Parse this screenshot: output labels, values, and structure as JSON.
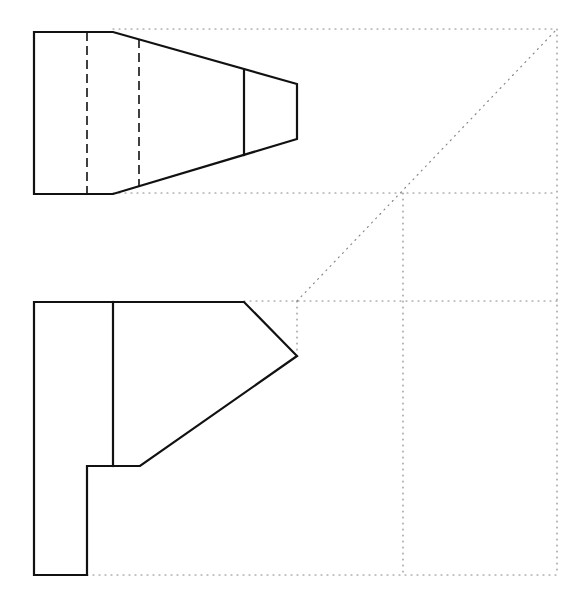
{
  "diagram": {
    "type": "orthographic-projection",
    "views": [
      "top-view",
      "front-view",
      "side-view-construction"
    ],
    "colors": {
      "object_line": "#111111",
      "projection_line": "#888888",
      "background": "#ffffff"
    },
    "top_view": {
      "outline": [
        [
          34,
          32
        ],
        [
          113,
          32
        ],
        [
          297,
          84
        ],
        [
          297,
          139
        ],
        [
          113,
          194
        ],
        [
          34,
          194
        ]
      ],
      "visible_lines": [
        [
          [
            244,
            70
          ],
          [
            244,
            155
          ]
        ]
      ],
      "hidden_lines": [
        [
          [
            87,
            32
          ],
          [
            87,
            194
          ]
        ],
        [
          [
            139,
            39
          ],
          [
            139,
            187
          ]
        ]
      ]
    },
    "front_view": {
      "outline": [
        [
          34,
          302
        ],
        [
          244,
          302
        ],
        [
          297,
          356
        ],
        [
          140,
          466
        ],
        [
          87,
          466
        ],
        [
          87,
          575
        ],
        [
          34,
          575
        ]
      ],
      "visible_lines": [
        [
          [
            113,
            302
          ],
          [
            113,
            466
          ]
        ]
      ]
    },
    "projection_lines": {
      "horizontal": [
        [
          [
            113,
            29
          ],
          [
            557,
            29
          ]
        ],
        [
          [
            113,
            193
          ],
          [
            557,
            193
          ]
        ],
        [
          [
            244,
            301
          ],
          [
            557,
            301
          ]
        ],
        [
          [
            87,
            575
          ],
          [
            557,
            575
          ]
        ]
      ],
      "vertical": [
        [
          [
            557,
            29
          ],
          [
            557,
            575
          ]
        ],
        [
          [
            403,
            193
          ],
          [
            403,
            575
          ]
        ],
        [
          [
            297,
            301
          ],
          [
            297,
            356
          ]
        ]
      ],
      "miter_line": [
        [
          297,
          301
        ],
        [
          557,
          29
        ]
      ]
    }
  }
}
